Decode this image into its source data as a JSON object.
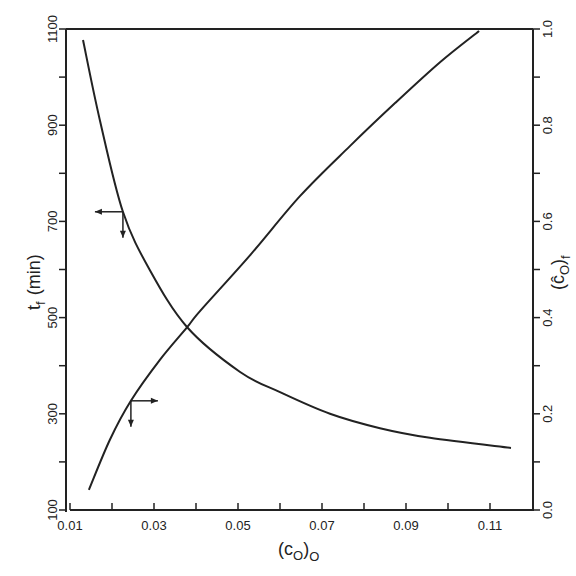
{
  "chart_data": {
    "type": "line",
    "title": "",
    "xlabel": "(c_O)_O",
    "ylabel_left": "t_f (min)",
    "ylabel_right": "(ĉ_O)_f",
    "xlim": [
      0.01,
      0.12
    ],
    "ylim_left": [
      100,
      1100
    ],
    "ylim_right": [
      0.0,
      1.0
    ],
    "x_ticks": [
      0.01,
      0.02,
      0.03,
      0.04,
      0.05,
      0.06,
      0.07,
      0.08,
      0.09,
      0.1,
      0.11
    ],
    "x_tick_labels": [
      "0.01",
      "",
      "0.03",
      "",
      "0.05",
      "",
      "0.07",
      "",
      "0.09",
      "",
      "0.11"
    ],
    "y_left_ticks": [
      100,
      200,
      300,
      400,
      500,
      600,
      700,
      800,
      900,
      1000,
      1100
    ],
    "y_left_tick_labels": [
      "100",
      "",
      "300",
      "",
      "500",
      "",
      "700",
      "",
      "900",
      "",
      "1100"
    ],
    "y_right_ticks": [
      0.0,
      0.1,
      0.2,
      0.3,
      0.4,
      0.5,
      0.6,
      0.7,
      0.8,
      0.9,
      1.0
    ],
    "y_right_tick_labels": [
      "0.0",
      "",
      "0.2",
      "",
      "0.4",
      "",
      "0.6",
      "",
      "0.8",
      "",
      "1.0"
    ],
    "grid": false,
    "legend": "none (arrows indicate axis for each curve)",
    "series": [
      {
        "name": "t_f (min)",
        "axis": "left",
        "x": [
          0.0131,
          0.0171,
          0.0226,
          0.029,
          0.0379,
          0.0505,
          0.06,
          0.0719,
          0.0838,
          0.0957,
          0.115
        ],
        "values": [
          1077,
          911,
          720,
          599,
          480,
          387,
          345,
          300,
          270,
          250,
          229
        ]
      },
      {
        "name": "(ĉ_O)_f",
        "axis": "right",
        "x": [
          0.0145,
          0.0195,
          0.0245,
          0.0314,
          0.0379,
          0.041,
          0.0529,
          0.0648,
          0.0767,
          0.0874,
          0.0981,
          0.1074
        ],
        "values": [
          0.042,
          0.146,
          0.227,
          0.312,
          0.38,
          0.414,
          0.53,
          0.653,
          0.757,
          0.846,
          0.931,
          0.996
        ]
      }
    ],
    "annotations": [
      {
        "type": "arrow-pair",
        "at_series": "t_f (min)",
        "x": 0.0226,
        "direction": "left",
        "meaning": "read on left axis"
      },
      {
        "type": "arrow-pair",
        "at_series": "(ĉ_O)_f",
        "x": 0.0245,
        "direction": "right",
        "meaning": "read on right axis"
      }
    ]
  },
  "labels": {
    "xlabel_main": "(c",
    "xlabel_sub": "O",
    "xlabel_close": ")",
    "xlabel_outer_sub": "O",
    "ylabel_left_main": "t",
    "ylabel_left_sub": "f",
    "ylabel_left_unit": "(min)",
    "ylabel_right_open": "(",
    "ylabel_right_main": "ĉ",
    "ylabel_right_sub": "O",
    "ylabel_right_close": ")",
    "ylabel_right_outer_sub": "f"
  },
  "colors": {
    "line": "#222222",
    "axis": "#222222",
    "background": "#ffffff"
  }
}
